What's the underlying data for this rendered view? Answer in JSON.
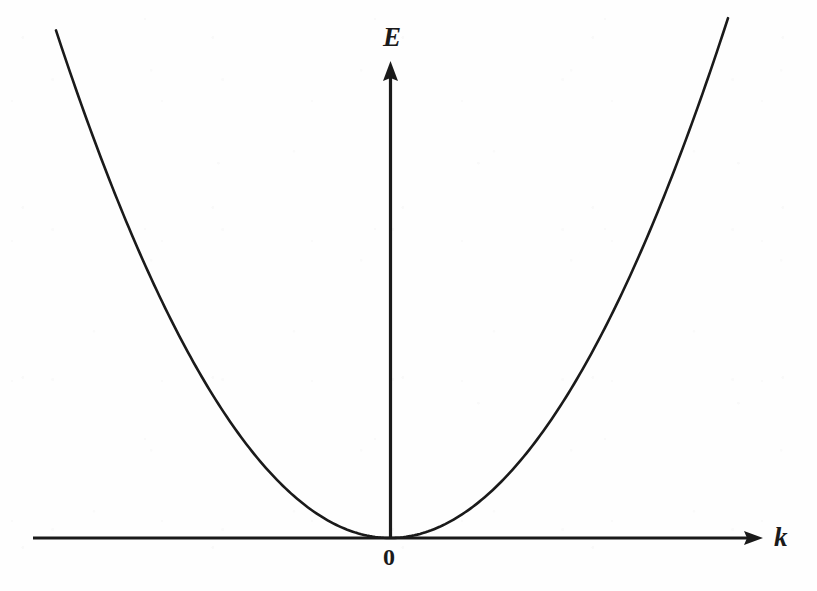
{
  "figure": {
    "background_color": "#fefefe",
    "ink_color": "#1a1a1a",
    "width": 817,
    "height": 591
  },
  "labels": {
    "y_axis": "E",
    "x_axis": "k",
    "origin": "0"
  },
  "chart_data": {
    "type": "line",
    "title": "",
    "subtitle": "",
    "xlabel": "k",
    "ylabel": "E",
    "grid": false,
    "legend": null,
    "annotations": [
      {
        "text": "E",
        "role": "y-axis-label",
        "x": 0,
        "y": 1.0
      },
      {
        "text": "k",
        "role": "x-axis-label",
        "x": 1.0,
        "y": 0
      },
      {
        "text": "0",
        "role": "origin-label",
        "x": 0,
        "y": 0
      }
    ],
    "axes": {
      "x_axis_arrow": true,
      "y_axis_arrow": true,
      "x_axis_pixel_y": 538,
      "y_axis_pixel_x": 390,
      "x_axis_pixel_start": 33,
      "x_axis_pixel_end": 763,
      "y_axis_pixel_top": 62,
      "ticks": [],
      "tick_labels": []
    },
    "xlim": [
      -334,
      338
    ],
    "ylim": [
      0,
      476
    ],
    "series": [
      {
        "name": "E(k) = ħ²k²/2m*",
        "shape": "parabola",
        "vertex": [
          0,
          0
        ],
        "coefficient": 0.00455,
        "x": [
          -334,
          -300,
          -260,
          -220,
          -180,
          -140,
          -100,
          -60,
          -20,
          0,
          20,
          60,
          100,
          140,
          180,
          220,
          260,
          300,
          338
        ],
        "values": [
          507,
          410,
          308,
          220,
          147,
          89,
          46,
          16,
          2,
          0,
          2,
          16,
          46,
          89,
          147,
          220,
          308,
          410,
          520
        ]
      }
    ]
  }
}
